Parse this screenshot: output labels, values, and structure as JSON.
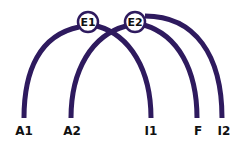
{
  "diagram": {
    "type": "dependency-arcs",
    "stroke_color": "#2e1a5e",
    "nodes": [
      {
        "id": "E1",
        "label": "E1",
        "cx": 88,
        "cy": 22
      },
      {
        "id": "E2",
        "label": "E2",
        "cx": 135,
        "cy": 22
      }
    ],
    "leaves": [
      {
        "id": "A1",
        "label": "A1",
        "x": 24
      },
      {
        "id": "A2",
        "label": "A2",
        "x": 71
      },
      {
        "id": "I1",
        "label": "I1",
        "x": 151
      },
      {
        "id": "F",
        "label": "F",
        "x": 197
      },
      {
        "id": "I2",
        "label": "I2",
        "x": 222
      }
    ],
    "edges": [
      {
        "from": "E1",
        "to": "A1"
      },
      {
        "from": "E1",
        "to": "I1"
      },
      {
        "from": "E2",
        "to": "A2"
      },
      {
        "from": "E2",
        "to": "F"
      },
      {
        "from": "E2",
        "to": "I2"
      }
    ]
  }
}
